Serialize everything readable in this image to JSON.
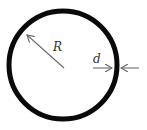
{
  "diagram": {
    "labels": {
      "radius": "R",
      "thickness": "d"
    },
    "colors": {
      "ring": "#0a0a0a",
      "arrow": "#6b6b6b",
      "text": "#333333",
      "background": "#ffffff"
    },
    "ring": {
      "cx": 63,
      "cy": 65,
      "r": 54,
      "stroke_width": 5
    },
    "arrows": [
      {
        "name": "radius-arrow",
        "from": [
          64,
          68
        ],
        "to": [
          26,
          34
        ]
      },
      {
        "name": "thickness-arrow-left",
        "from": [
          93,
          68
        ],
        "to": [
          112,
          68
        ]
      },
      {
        "name": "thickness-arrow-right",
        "from": [
          139,
          68
        ],
        "to": [
          121,
          68
        ]
      }
    ]
  }
}
